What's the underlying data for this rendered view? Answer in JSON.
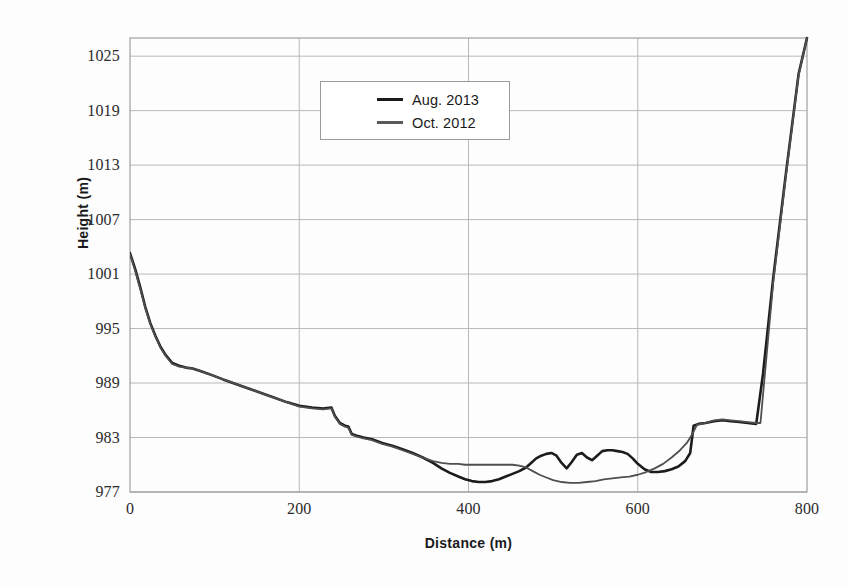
{
  "chart_data": {
    "type": "line",
    "title": "",
    "xlabel": "Distance (m)",
    "ylabel": "Height (m)",
    "xlim": [
      0,
      800
    ],
    "ylim": [
      977,
      1027
    ],
    "xticks": [
      0,
      200,
      400,
      600,
      800
    ],
    "yticks": [
      977,
      983,
      989,
      995,
      1001,
      1007,
      1013,
      1019,
      1025
    ],
    "grid": true,
    "legend_position": "upper-center",
    "series": [
      {
        "name": "Aug. 2013",
        "color": "#1c1c1c",
        "width": 2.6,
        "x": [
          0,
          6,
          12,
          18,
          24,
          30,
          36,
          42,
          50,
          58,
          66,
          74,
          84,
          96,
          110,
          125,
          140,
          155,
          170,
          185,
          200,
          215,
          228,
          238,
          242,
          248,
          254,
          258,
          262,
          268,
          276,
          286,
          298,
          310,
          322,
          334,
          346,
          358,
          368,
          378,
          388,
          396,
          404,
          412,
          420,
          428,
          436,
          444,
          452,
          460,
          468,
          474,
          480,
          486,
          492,
          498,
          504,
          510,
          516,
          522,
          528,
          534,
          540,
          546,
          552,
          558,
          564,
          570,
          576,
          582,
          588,
          594,
          600,
          608,
          616,
          624,
          632,
          640,
          648,
          656,
          662,
          666,
          672,
          680,
          690,
          700,
          710,
          720,
          730,
          740,
          748,
          760,
          775,
          790,
          800
        ],
        "y": [
          1003.3,
          1001.6,
          999.6,
          997.4,
          995.6,
          994.2,
          993.0,
          992.1,
          991.2,
          990.9,
          990.7,
          990.6,
          990.3,
          989.9,
          989.4,
          988.9,
          988.4,
          987.9,
          987.4,
          986.9,
          986.5,
          986.3,
          986.2,
          986.3,
          985.4,
          984.6,
          984.3,
          984.2,
          983.4,
          983.2,
          983.0,
          982.8,
          982.4,
          982.1,
          981.7,
          981.3,
          980.8,
          980.2,
          979.6,
          979.1,
          978.7,
          978.4,
          978.2,
          978.1,
          978.1,
          978.2,
          978.4,
          978.7,
          979.0,
          979.3,
          979.7,
          980.2,
          980.7,
          981.0,
          981.2,
          981.3,
          981.0,
          980.2,
          979.6,
          980.3,
          981.1,
          981.3,
          980.8,
          980.5,
          981.0,
          981.5,
          981.6,
          981.6,
          981.5,
          981.4,
          981.2,
          980.7,
          980.1,
          979.5,
          979.2,
          979.2,
          979.3,
          979.5,
          979.8,
          980.4,
          981.3,
          984.3,
          984.5,
          984.6,
          984.8,
          984.9,
          984.8,
          984.7,
          984.6,
          984.5,
          990.0,
          1000.5,
          1012.0,
          1023.0,
          1027.0
        ]
      },
      {
        "name": "Oct. 2012",
        "color": "#4f4f4f",
        "width": 1.8,
        "x": [
          0,
          6,
          12,
          18,
          24,
          30,
          36,
          42,
          50,
          58,
          66,
          74,
          84,
          96,
          110,
          125,
          140,
          155,
          170,
          185,
          200,
          215,
          228,
          238,
          242,
          248,
          254,
          258,
          262,
          268,
          276,
          286,
          298,
          310,
          322,
          334,
          346,
          358,
          368,
          378,
          388,
          396,
          404,
          412,
          420,
          428,
          436,
          444,
          452,
          460,
          468,
          476,
          484,
          492,
          500,
          510,
          520,
          530,
          540,
          550,
          560,
          570,
          580,
          590,
          600,
          610,
          620,
          630,
          640,
          650,
          658,
          664,
          670,
          680,
          690,
          700,
          710,
          720,
          730,
          740,
          745,
          760,
          775,
          790,
          800
        ],
        "y": [
          1003.2,
          1001.4,
          999.4,
          997.3,
          995.5,
          994.1,
          992.9,
          992.0,
          991.1,
          990.8,
          990.7,
          990.6,
          990.3,
          989.9,
          989.4,
          988.9,
          988.4,
          987.9,
          987.4,
          986.9,
          986.4,
          986.2,
          986.1,
          986.2,
          985.3,
          984.5,
          984.2,
          984.1,
          983.3,
          983.1,
          982.9,
          982.7,
          982.3,
          982.0,
          981.6,
          981.2,
          980.8,
          980.4,
          980.2,
          980.1,
          980.1,
          980.0,
          980.0,
          980.0,
          980.0,
          980.0,
          980.0,
          980.0,
          980.0,
          979.9,
          979.7,
          979.3,
          978.9,
          978.6,
          978.3,
          978.1,
          978.0,
          978.0,
          978.1,
          978.2,
          978.4,
          978.5,
          978.6,
          978.7,
          978.9,
          979.2,
          979.6,
          980.1,
          980.8,
          981.6,
          982.4,
          983.3,
          984.4,
          984.6,
          984.9,
          985.0,
          984.9,
          984.8,
          984.7,
          984.6,
          984.6,
          1000.0,
          1011.8,
          1022.9,
          1027.0
        ]
      }
    ]
  },
  "legend": {
    "entries": [
      {
        "label": "Aug. 2013"
      },
      {
        "label": "Oct. 2012"
      }
    ]
  },
  "axes": {
    "y_title": "Height (m)",
    "x_title": "Distance (m)",
    "y_labels": [
      "1025",
      "1019",
      "1013",
      "1007",
      "1001",
      "995",
      "989",
      "983",
      "977"
    ],
    "x_labels": [
      "0",
      "200",
      "400",
      "600",
      "800"
    ]
  }
}
